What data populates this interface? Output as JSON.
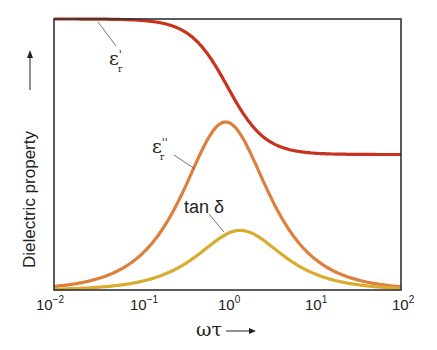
{
  "chart_data": {
    "type": "line",
    "title": "",
    "xlabel": "ωτ →",
    "ylabel": "Dielectric property →",
    "xscale": "log",
    "xlim": [
      0.01,
      100
    ],
    "ylim": [
      0,
      1
    ],
    "grid": false,
    "legend": "inline annotations",
    "x_ticks": [
      {
        "base": "10",
        "exp": "−2",
        "value": 0.01
      },
      {
        "base": "10",
        "exp": "−1",
        "value": 0.1
      },
      {
        "base": "10",
        "exp": "0",
        "value": 1
      },
      {
        "base": "10",
        "exp": "1",
        "value": 10
      },
      {
        "base": "10",
        "exp": "2",
        "value": 100
      }
    ],
    "series": [
      {
        "name": "ε′r",
        "label_main": "ε",
        "label_prime": "'",
        "label_sub": "r",
        "color": "#c8321e",
        "model": "debye_real",
        "high": 1.0,
        "low": 0.5,
        "peak_x": 1.0
      },
      {
        "name": "ε″r",
        "label_main": "ε",
        "label_prime": "''",
        "label_sub": "r",
        "color": "#de7f3e",
        "model": "debye_imag",
        "peak_value": 0.62,
        "peak_x": 0.95
      },
      {
        "name": "tan δ",
        "label_main": "tan δ",
        "color": "#d9ac2e",
        "model": "debye_loss",
        "peak_value": 0.22,
        "peak_x": 1.4
      }
    ],
    "annotations": [
      {
        "series": "ε′r",
        "text": "ε′r",
        "x": 0.027,
        "position": "below curve at plateau"
      },
      {
        "series": "ε″r",
        "text": "ε″r",
        "x": 0.22,
        "position": "left of rising flank"
      },
      {
        "series": "tan δ",
        "text": "tan δ",
        "x": 0.8,
        "position": "above curve, left of peak"
      }
    ]
  },
  "axes": {
    "xlabel_main": "ωτ",
    "xlabel_arrow": "⟶",
    "ylabel_main": "Dielectric property",
    "ylabel_arrow": "⟶"
  }
}
